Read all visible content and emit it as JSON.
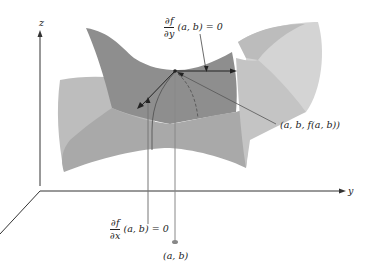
{
  "figure": {
    "axes": {
      "z_label": "z",
      "y_label": "y"
    },
    "labels": {
      "fy": {
        "num": "∂f",
        "den": "∂y",
        "rest": "(a, b) = 0"
      },
      "fx": {
        "num": "∂f",
        "den": "∂x",
        "rest": "(a, b) = 0"
      },
      "point3d": "(a, b, f(a, b))",
      "point2d": "(a, b)"
    },
    "colors": {
      "surface_dark": "#8c8c8c",
      "surface_mid": "#a8a8a8",
      "surface_light": "#c9c9c9",
      "surface_lightest": "#dcdcdc",
      "axis": "#333333",
      "line": "#555555",
      "point": "#777777"
    }
  }
}
